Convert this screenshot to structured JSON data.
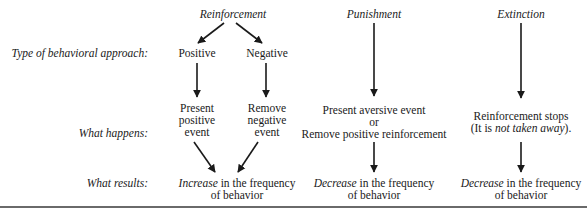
{
  "columns": {
    "reinforcement": {
      "title": "Reinforcement",
      "types": [
        {
          "label": "Positive",
          "happens": [
            "Present",
            "positive",
            "event"
          ]
        },
        {
          "label": "Negative",
          "happens": [
            "Remove",
            "negative",
            "event"
          ]
        }
      ],
      "result": {
        "emph": "Increase",
        "rest": " in the frequency",
        "line2": "of behavior"
      }
    },
    "punishment": {
      "title": "Punishment",
      "happens": [
        "Present aversive event",
        "or",
        "Remove positive reinforcement"
      ],
      "result": {
        "emph": "Decrease",
        "rest": " in the frequency",
        "line2": "of behavior"
      }
    },
    "extinction": {
      "title": "Extinction",
      "happens_line1": "Reinforcement stops",
      "happens_line2_pre": "(It is ",
      "happens_line2_emph": "not taken away",
      "happens_line2_post": ").",
      "result": {
        "emph": "Decrease",
        "rest": " in the frequency",
        "line2": "of behavior"
      }
    }
  },
  "row_labels": {
    "type": "Type of behavioral approach:",
    "happens": "What happens:",
    "results": "What results:"
  },
  "colors": {
    "ink": "#1a1a1a",
    "rule": "#6a6a6a"
  }
}
